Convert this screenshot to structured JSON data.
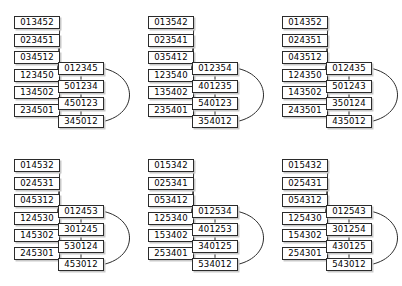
{
  "diagram": {
    "layout": {
      "rows": 2,
      "cols": 3,
      "clusters": 6
    },
    "clusters": [
      {
        "id": "cluster-1",
        "leaves": [
          "013452",
          "023451",
          "034512",
          "123450",
          "134502",
          "234501"
        ],
        "chain": [
          "012345",
          "501234",
          "450123",
          "345012"
        ]
      },
      {
        "id": "cluster-2",
        "leaves": [
          "013542",
          "023541",
          "035412",
          "123540",
          "135402",
          "235401"
        ],
        "chain": [
          "012354",
          "401235",
          "540123",
          "354012"
        ]
      },
      {
        "id": "cluster-3",
        "leaves": [
          "014352",
          "024351",
          "043512",
          "124350",
          "143502",
          "243501"
        ],
        "chain": [
          "012435",
          "501243",
          "350124",
          "435012"
        ]
      },
      {
        "id": "cluster-4",
        "leaves": [
          "014532",
          "024531",
          "045312",
          "124530",
          "145302",
          "245301"
        ],
        "chain": [
          "012453",
          "301245",
          "530124",
          "453012"
        ]
      },
      {
        "id": "cluster-5",
        "leaves": [
          "015342",
          "025341",
          "053412",
          "125340",
          "153402",
          "253401"
        ],
        "chain": [
          "012534",
          "401253",
          "340125",
          "534012"
        ]
      },
      {
        "id": "cluster-6",
        "leaves": [
          "015432",
          "025431",
          "054312",
          "125430",
          "154302",
          "254301"
        ],
        "chain": [
          "012543",
          "301254",
          "430125",
          "543012"
        ]
      }
    ]
  }
}
